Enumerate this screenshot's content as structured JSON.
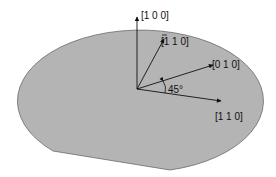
{
  "diagram": {
    "type": "wafer-crystal-orientation",
    "wafer_fill": "#b4b4b4",
    "wafer_stroke": "#6a6a6a",
    "arrow_color": "#111111",
    "vectors": [
      {
        "id": "v100",
        "label": "[1 0 0]"
      },
      {
        "id": "v-110",
        "label": "[1 1 0]",
        "overbar_first": true
      },
      {
        "id": "v010",
        "label": "[0 1 0]"
      },
      {
        "id": "v110",
        "label": "[1 1 0]"
      }
    ],
    "angle_label": "45°"
  }
}
